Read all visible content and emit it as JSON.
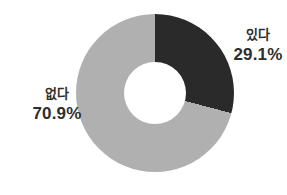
{
  "chart_data": {
    "type": "pie",
    "subtype": "donut",
    "categories": [
      "있다",
      "없다"
    ],
    "values": [
      29.1,
      70.9
    ],
    "percent_labels": [
      "29.1%",
      "70.9%"
    ],
    "colors": [
      "#2a2a2a",
      "#b0b0b0"
    ],
    "start_angle_deg": 0,
    "direction": "clockwise",
    "hole_ratio": 0.4,
    "legend_position": "none",
    "labels_position": "outside"
  },
  "slices": [
    {
      "name": "있다",
      "percent_label": "29.1%",
      "color": "#2a2a2a",
      "label_side": "right"
    },
    {
      "name": "없다",
      "percent_label": "70.9%",
      "color": "#b0b0b0",
      "label_side": "left"
    }
  ],
  "background_color": "#ffffff",
  "text_color": "#2e2e2e"
}
